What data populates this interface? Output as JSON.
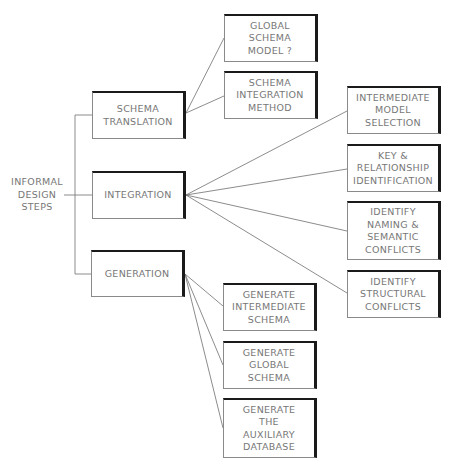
{
  "diagram": {
    "type": "tree",
    "root": {
      "label": "INFORMAL\nDESIGN\nSTEPS"
    },
    "level1": [
      {
        "id": "schema-translation",
        "label": "SCHEMA\nTRANSLATION",
        "children": [
          {
            "id": "global-schema-model",
            "label": "GLOBAL\nSCHEMA\nMODEL  ?"
          },
          {
            "id": "schema-integration-method",
            "label": "SCHEMA\nINTEGRATION\nMETHOD"
          }
        ]
      },
      {
        "id": "integration",
        "label": "INTEGRATION",
        "children": [
          {
            "id": "intermediate-model-selection",
            "label": "INTERMEDIATE\nMODEL\nSELECTION"
          },
          {
            "id": "key-relationship-identification",
            "label": "KEY  &\nRELATIONSHIP\nIDENTIFICATION"
          },
          {
            "id": "identify-naming-semantic-conflicts",
            "label": "IDENTIFY\nNAMING  &\nSEMANTIC\nCONFLICTS"
          },
          {
            "id": "identify-structural-conflicts",
            "label": "IDENTIFY\nSTRUCTURAL\nCONFLICTS"
          }
        ]
      },
      {
        "id": "generation",
        "label": "GENERATION",
        "children": [
          {
            "id": "generate-intermediate-schema",
            "label": "GENERATE\nINTERMEDIATE\nSCHEMA"
          },
          {
            "id": "generate-global-schema",
            "label": "GENERATE\nGLOBAL\nSCHEMA"
          },
          {
            "id": "generate-auxiliary-database",
            "label": "GENERATE\nTHE\nAUXILIARY\nDATABASE"
          }
        ]
      }
    ],
    "colors": {
      "line": "#6e6e6e",
      "box_shadow_edge": "#1a1a1a",
      "text": "#777777",
      "background": "#ffffff"
    }
  }
}
